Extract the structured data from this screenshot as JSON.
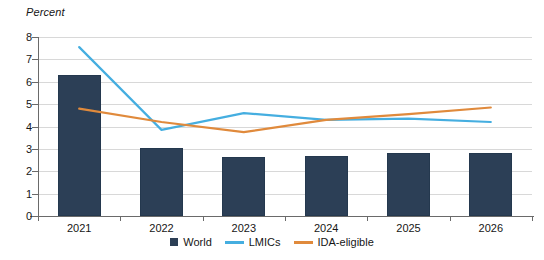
{
  "chart_data": {
    "type": "bar",
    "title": "",
    "subtitle": "",
    "ylabel": "Percent",
    "xlabel": "",
    "categories": [
      "2021",
      "2022",
      "2023",
      "2024",
      "2025",
      "2026"
    ],
    "ylim": [
      0,
      8
    ],
    "ytick_labels": [
      "0",
      "1",
      "2",
      "3",
      "4",
      "5",
      "6",
      "7",
      "8"
    ],
    "ytick_values": [
      0,
      1,
      2,
      3,
      4,
      5,
      6,
      7,
      8
    ],
    "grid": true,
    "legend_position": "bottom",
    "series": [
      {
        "name": "World",
        "type": "bar",
        "color": "#2c3f56",
        "values": [
          6.3,
          3.05,
          2.65,
          2.7,
          2.8,
          2.8
        ]
      },
      {
        "name": "LMICs",
        "type": "line",
        "color": "#45AEE0",
        "values": [
          7.55,
          3.85,
          4.6,
          4.3,
          4.35,
          4.2
        ]
      },
      {
        "name": "IDA-eligible",
        "type": "line",
        "color": "#E08A3C",
        "values": [
          4.8,
          4.2,
          3.75,
          4.3,
          4.55,
          4.85
        ]
      }
    ]
  },
  "legend": {
    "items": [
      {
        "label": "World",
        "marker": "square-swatch",
        "color": "#2c3f56"
      },
      {
        "label": "LMICs",
        "marker": "line-swatch",
        "color": "#45AEE0"
      },
      {
        "label": "IDA-eligible",
        "marker": "line-swatch",
        "color": "#E08A3C"
      }
    ]
  },
  "colors": {
    "bar": "#2c3f56",
    "lmics_line": "#45AEE0",
    "ida_line": "#E08A3C",
    "gridline": "#d8d8d8",
    "axis": "#6a6a6a",
    "background": "#ffffff"
  }
}
